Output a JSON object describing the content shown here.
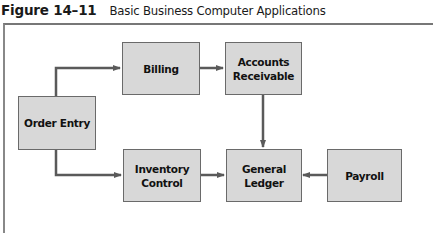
{
  "figure": {
    "number": "Figure 14–11",
    "caption": "Basic Business Computer Applications"
  },
  "nodes": {
    "order_entry": {
      "label": "Order Entry"
    },
    "billing": {
      "label": "Billing"
    },
    "accounts_receivable": {
      "label_line1": "Accounts",
      "label_line2": "Receivable"
    },
    "inventory_control": {
      "label_line1": "Inventory",
      "label_line2": "Control"
    },
    "general_ledger": {
      "label_line1": "General",
      "label_line2": "Ledger"
    },
    "payroll": {
      "label": "Payroll"
    }
  },
  "edges": [
    {
      "from": "Order Entry",
      "to": "Billing"
    },
    {
      "from": "Order Entry",
      "to": "Inventory Control"
    },
    {
      "from": "Billing",
      "to": "Accounts Receivable"
    },
    {
      "from": "Accounts Receivable",
      "to": "General Ledger"
    },
    {
      "from": "Inventory Control",
      "to": "General Ledger"
    },
    {
      "from": "Payroll",
      "to": "General Ledger"
    }
  ],
  "colors": {
    "box_fill": "#d8d8d8",
    "box_border": "#6a6a6a",
    "arrow": "#5a5a5a"
  }
}
